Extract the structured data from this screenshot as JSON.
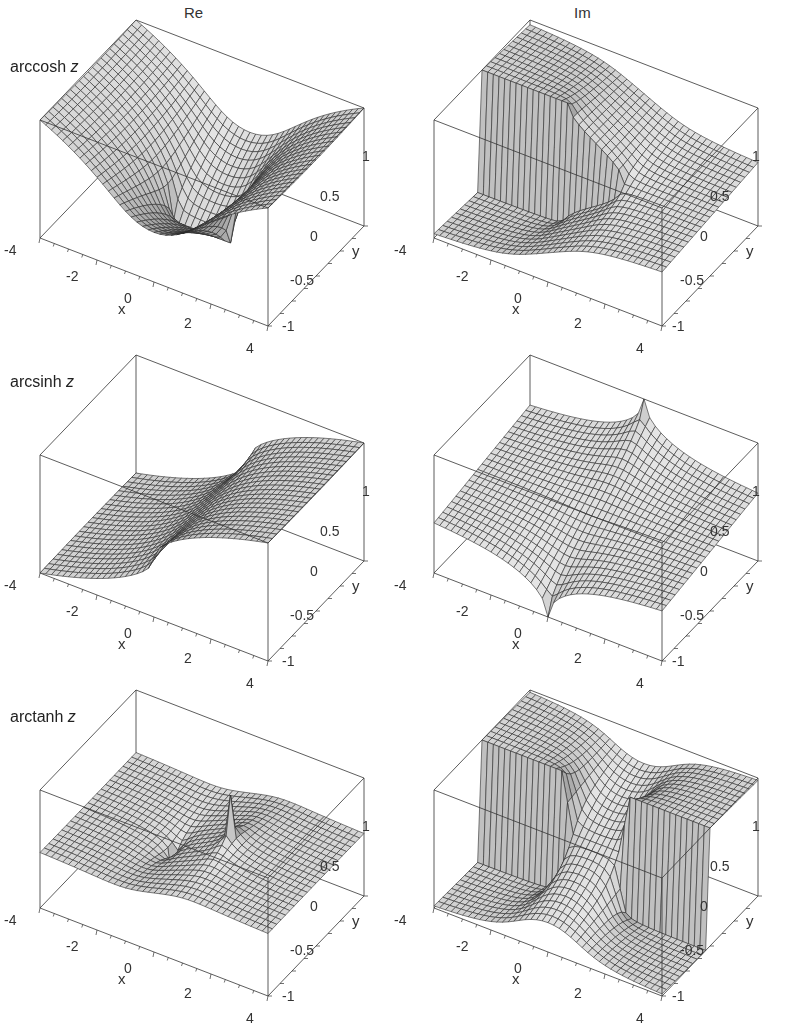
{
  "figure": {
    "column_titles": [
      "Re",
      "Im"
    ],
    "row_labels": [
      {
        "name": "arccosh",
        "var": "z"
      },
      {
        "name": "arcsinh",
        "var": "z"
      },
      {
        "name": "arctanh",
        "var": "z"
      }
    ],
    "x_axis": {
      "label": "x",
      "ticks": [
        "-4",
        "-2",
        "0",
        "2",
        "4"
      ]
    },
    "y_axis": {
      "label": "y",
      "ticks": [
        "-1",
        "-0.5",
        "0",
        "0.5",
        "1"
      ]
    }
  },
  "chart_data": [
    {
      "type": "surface",
      "title": "Re arccosh z",
      "function": "arccosh",
      "part": "Re",
      "xlabel": "x",
      "ylabel": "y",
      "xlim": [
        -4,
        4
      ],
      "ylim": [
        -1,
        1
      ],
      "xticks": [
        -4,
        -2,
        0,
        2,
        4
      ],
      "yticks": [
        -1,
        -0.5,
        0,
        0.5,
        1
      ],
      "grid": "mesh",
      "color": "#b8b8b8"
    },
    {
      "type": "surface",
      "title": "Im arccosh z",
      "function": "arccosh",
      "part": "Im",
      "xlabel": "x",
      "ylabel": "y",
      "xlim": [
        -4,
        4
      ],
      "ylim": [
        -1,
        1
      ],
      "xticks": [
        -4,
        -2,
        0,
        2,
        4
      ],
      "yticks": [
        -1,
        -0.5,
        0,
        0.5,
        1
      ],
      "grid": "mesh",
      "color": "#b8b8b8",
      "note": "branch cut discontinuity along real axis x<1"
    },
    {
      "type": "surface",
      "title": "Re arcsinh z",
      "function": "arcsinh",
      "part": "Re",
      "xlabel": "x",
      "ylabel": "y",
      "xlim": [
        -4,
        4
      ],
      "ylim": [
        -1,
        1
      ],
      "xticks": [
        -4,
        -2,
        0,
        2,
        4
      ],
      "yticks": [
        -1,
        -0.5,
        0,
        0.5,
        1
      ],
      "grid": "mesh",
      "color": "#b8b8b8"
    },
    {
      "type": "surface",
      "title": "Im arcsinh z",
      "function": "arcsinh",
      "part": "Im",
      "xlabel": "x",
      "ylabel": "y",
      "xlim": [
        -4,
        4
      ],
      "ylim": [
        -1,
        1
      ],
      "xticks": [
        -4,
        -2,
        0,
        2,
        4
      ],
      "yticks": [
        -1,
        -0.5,
        0,
        0.5,
        1
      ],
      "grid": "mesh",
      "color": "#b8b8b8",
      "note": "cusps at y=±1, x=0"
    },
    {
      "type": "surface",
      "title": "Re arctanh z",
      "function": "arctanh",
      "part": "Re",
      "xlabel": "x",
      "ylabel": "y",
      "xlim": [
        -4,
        4
      ],
      "ylim": [
        -1,
        1
      ],
      "xticks": [
        -4,
        -2,
        0,
        2,
        4
      ],
      "yticks": [
        -1,
        -0.5,
        0,
        0.5,
        1
      ],
      "grid": "mesh",
      "color": "#b8b8b8"
    },
    {
      "type": "surface",
      "title": "Im arctanh z",
      "function": "arctanh",
      "part": "Im",
      "xlabel": "x",
      "ylabel": "y",
      "xlim": [
        -4,
        4
      ],
      "ylim": [
        -1,
        1
      ],
      "xticks": [
        -4,
        -2,
        0,
        2,
        4
      ],
      "yticks": [
        -1,
        -0.5,
        0,
        0.5,
        1
      ],
      "grid": "mesh",
      "color": "#b8b8b8",
      "note": "branch cut discontinuities along real axis |x|>1"
    }
  ]
}
